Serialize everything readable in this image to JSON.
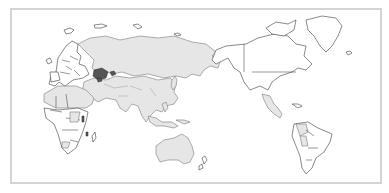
{
  "map": {
    "projection": "pacific-centered world",
    "frame": {
      "border_color": "#d4d4d4",
      "background": "#ffffff"
    },
    "categories": [
      {
        "id": "cat-a",
        "fill": "#e6e6e6",
        "stroke": "#7a7a7a",
        "regions": [
          "Russia",
          "China",
          "Mongolia",
          "India",
          "Middle East",
          "Southeast Asia",
          "Australia",
          "Northern Africa",
          "Mexico",
          "Central America",
          "Peru",
          "Colombia"
        ]
      },
      {
        "id": "cat-b",
        "fill": "#ffffff",
        "stroke": "#3a3a3a",
        "regions": [
          "Canada",
          "United States",
          "Alaska",
          "Greenland",
          "Europe",
          "Southern Africa",
          "Brazil",
          "Argentina",
          "Chile",
          "New Zealand"
        ]
      },
      {
        "id": "cat-c",
        "fill": "#555555",
        "stroke": "#2a2a2a",
        "regions": [
          "Kazakhstan",
          "Uzbekistan",
          "Kyrgyzstan",
          "Tajikistan",
          "East Africa patches"
        ]
      }
    ],
    "legend": null,
    "title": null
  }
}
